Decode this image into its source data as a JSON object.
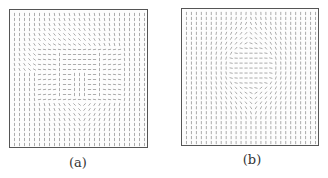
{
  "figure": {
    "panels": [
      {
        "id": "a",
        "caption": "(a)",
        "box": {
          "left": 9,
          "top": 9,
          "width": 139,
          "height": 139
        },
        "caption_pos": {
          "left": 58,
          "top": 155
        },
        "grid": {
          "cols": 27,
          "rows": 27,
          "spacing": 5.1
        },
        "pattern": "square-vortex",
        "center": [
          0.5,
          0.46
        ],
        "inner_square_half": 0.16
      },
      {
        "id": "b",
        "caption": "(b)",
        "box": {
          "left": 181,
          "top": 8,
          "width": 138,
          "height": 138
        },
        "caption_pos": {
          "left": 232,
          "top": 152
        },
        "grid": {
          "cols": 27,
          "rows": 27,
          "spacing": 5.1
        },
        "pattern": "elliptic-vortex",
        "center": [
          0.5,
          0.42
        ],
        "radius_x": 0.32,
        "radius_y": 0.3
      }
    ],
    "colors": {
      "stroke": "#888888",
      "frame": "#555555",
      "text": "#333333"
    }
  }
}
